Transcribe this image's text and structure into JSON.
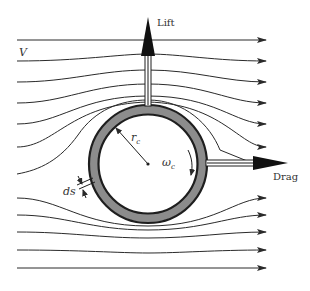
{
  "diagram": {
    "labels": {
      "velocity": "V",
      "lift": "Lift",
      "drag": "Drag",
      "radius_main": "r",
      "radius_sub": "c",
      "omega_main": "ω",
      "omega_sub": "c",
      "ds": "ds"
    },
    "colors": {
      "line": "#2a2a2a",
      "ring_fill": "#8c8c8c",
      "ring_border": "#1e1e1e",
      "arrow_fill": "#111111",
      "background": "#ffffff"
    },
    "streamlines_count": 12,
    "cylinder": {
      "rotation": "clockwise"
    }
  }
}
